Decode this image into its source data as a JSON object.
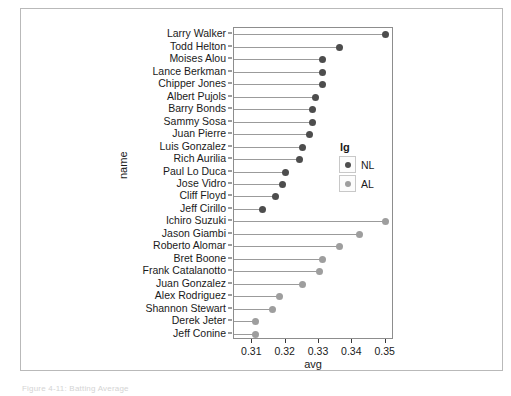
{
  "figure": {
    "caption": "Figure 4-11: Batting Average",
    "y_axis_title": "name",
    "x_axis_title": "avg",
    "legend_title": "lg"
  },
  "legend": {
    "entries": [
      {
        "label": "NL",
        "color": "#4d4d4d"
      },
      {
        "label": "AL",
        "color": "#9e9e9e"
      }
    ]
  },
  "chart_data": {
    "type": "bar",
    "title": "",
    "xlabel": "avg",
    "ylabel": "name",
    "xlim": [
      0.3045,
      0.3525
    ],
    "xticks": [
      "0.31",
      "0.32",
      "0.33",
      "0.34",
      "0.35"
    ],
    "xtick_values": [
      0.31,
      0.32,
      0.33,
      0.34,
      0.35
    ],
    "grid": false,
    "legend_position": "right-middle",
    "legend_title": "lg",
    "baseline": 0.3045,
    "categories": [
      "Larry Walker",
      "Todd Helton",
      "Moises Alou",
      "Lance Berkman",
      "Chipper Jones",
      "Albert Pujols",
      "Barry Bonds",
      "Sammy Sosa",
      "Juan Pierre",
      "Luis Gonzalez",
      "Rich Aurilia",
      "Paul Lo Duca",
      "Jose Vidro",
      "Cliff Floyd",
      "Jeff Cirillo",
      "Ichiro Suzuki",
      "Jason Giambi",
      "Roberto Alomar",
      "Bret Boone",
      "Frank Catalanotto",
      "Juan Gonzalez",
      "Alex Rodriguez",
      "Shannon Stewart",
      "Derek Jeter",
      "Jeff Conine"
    ],
    "values": [
      0.35,
      0.336,
      0.331,
      0.331,
      0.331,
      0.329,
      0.328,
      0.328,
      0.327,
      0.325,
      0.324,
      0.32,
      0.319,
      0.317,
      0.313,
      0.35,
      0.342,
      0.336,
      0.331,
      0.33,
      0.325,
      0.318,
      0.316,
      0.311,
      0.311
    ],
    "groups": [
      "NL",
      "NL",
      "NL",
      "NL",
      "NL",
      "NL",
      "NL",
      "NL",
      "NL",
      "NL",
      "NL",
      "NL",
      "NL",
      "NL",
      "NL",
      "AL",
      "AL",
      "AL",
      "AL",
      "AL",
      "AL",
      "AL",
      "AL",
      "AL",
      "AL"
    ],
    "series": [
      {
        "name": "NL",
        "color": "#4d4d4d",
        "points": [
          {
            "name": "Larry Walker",
            "avg": 0.35
          },
          {
            "name": "Todd Helton",
            "avg": 0.336
          },
          {
            "name": "Moises Alou",
            "avg": 0.331
          },
          {
            "name": "Lance Berkman",
            "avg": 0.331
          },
          {
            "name": "Chipper Jones",
            "avg": 0.331
          },
          {
            "name": "Albert Pujols",
            "avg": 0.329
          },
          {
            "name": "Barry Bonds",
            "avg": 0.328
          },
          {
            "name": "Sammy Sosa",
            "avg": 0.328
          },
          {
            "name": "Juan Pierre",
            "avg": 0.327
          },
          {
            "name": "Luis Gonzalez",
            "avg": 0.325
          },
          {
            "name": "Rich Aurilia",
            "avg": 0.324
          },
          {
            "name": "Paul Lo Duca",
            "avg": 0.32
          },
          {
            "name": "Jose Vidro",
            "avg": 0.319
          },
          {
            "name": "Cliff Floyd",
            "avg": 0.317
          },
          {
            "name": "Jeff Cirillo",
            "avg": 0.313
          }
        ]
      },
      {
        "name": "AL",
        "color": "#9e9e9e",
        "points": [
          {
            "name": "Ichiro Suzuki",
            "avg": 0.35
          },
          {
            "name": "Jason Giambi",
            "avg": 0.342
          },
          {
            "name": "Roberto Alomar",
            "avg": 0.336
          },
          {
            "name": "Bret Boone",
            "avg": 0.331
          },
          {
            "name": "Frank Catalanotto",
            "avg": 0.33
          },
          {
            "name": "Juan Gonzalez",
            "avg": 0.325
          },
          {
            "name": "Alex Rodriguez",
            "avg": 0.318
          },
          {
            "name": "Shannon Stewart",
            "avg": 0.316
          },
          {
            "name": "Derek Jeter",
            "avg": 0.311
          },
          {
            "name": "Jeff Conine",
            "avg": 0.311
          }
        ]
      }
    ]
  }
}
